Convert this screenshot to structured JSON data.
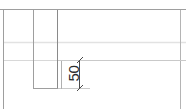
{
  "drawing": {
    "type": "technical-cad-drawing",
    "width": 186,
    "height": 109,
    "background_color": "#ffffff",
    "line_color": "#9a9a9a",
    "faint_line_color": "#dcdcdc",
    "dimension_color": "#4a4a4a",
    "text_color": "#2b2b2b",
    "dimension": {
      "value": "50",
      "orientation": "vertical",
      "label_rotation_deg": -90,
      "extent_from_y": 60,
      "extent_to_y": 88
    },
    "geometry": {
      "top_rail_y": 9,
      "left_edge_x": 3,
      "inner_left_x": 33,
      "inner_right_x": 58,
      "bottom_rail_y": 88,
      "right_edge_x": 181,
      "faint_rail_1_y": 42,
      "faint_rail_2_y": 60,
      "dimension_line_x": 79
    }
  }
}
